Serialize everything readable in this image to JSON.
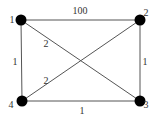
{
  "graph": {
    "nodes": [
      {
        "id": "1",
        "label": "1",
        "x": 21,
        "y": 20,
        "lx": 12,
        "ly": 23
      },
      {
        "id": "2",
        "label": "2",
        "x": 140,
        "y": 20,
        "lx": 146,
        "ly": 16
      },
      {
        "id": "3",
        "label": "3",
        "x": 140,
        "y": 101,
        "lx": 146,
        "ly": 108
      },
      {
        "id": "4",
        "label": "4",
        "x": 22,
        "y": 101,
        "lx": 11,
        "ly": 108
      }
    ],
    "edges": [
      {
        "from": "1",
        "to": "2",
        "weight": "100",
        "lx": 80,
        "ly": 14
      },
      {
        "from": "1",
        "to": "4",
        "weight": "1",
        "lx": 15,
        "ly": 65
      },
      {
        "from": "2",
        "to": "3",
        "weight": "1",
        "lx": 145,
        "ly": 65
      },
      {
        "from": "4",
        "to": "3",
        "weight": "1",
        "lx": 82,
        "ly": 114
      },
      {
        "from": "1",
        "to": "3",
        "weight": "2",
        "lx": 46,
        "ly": 47
      },
      {
        "from": "4",
        "to": "2",
        "weight": "2",
        "lx": 46,
        "ly": 84
      }
    ]
  }
}
